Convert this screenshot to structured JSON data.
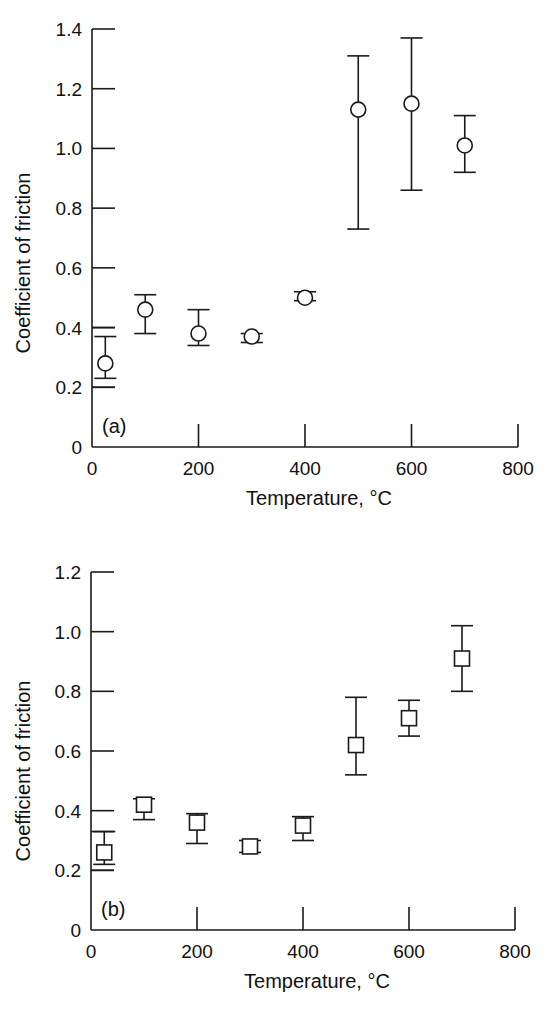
{
  "chart_data": [
    {
      "type": "scatter",
      "panel_label": "(a)",
      "marker": "circle",
      "xlabel": "Temperature, °C",
      "ylabel": "Coefficient of friction",
      "xlim": [
        0,
        800
      ],
      "ylim": [
        0,
        1.4
      ],
      "xticks": [
        0,
        200,
        400,
        600,
        800
      ],
      "yticks": [
        0,
        0.2,
        0.4,
        0.6,
        0.8,
        1.0,
        1.2,
        1.4
      ],
      "ytick_labels": [
        "0",
        "0.2",
        "0.4",
        "0.6",
        "0.8",
        "1.0",
        "1.2",
        "1.4"
      ],
      "grid": false,
      "extra_y_markers": [
        0.4,
        0.2
      ],
      "x": [
        25,
        100,
        200,
        300,
        400,
        500,
        600,
        700
      ],
      "values": [
        0.28,
        0.46,
        0.38,
        0.37,
        0.5,
        1.13,
        1.15,
        1.01
      ],
      "err_low": [
        0.23,
        0.38,
        0.34,
        0.35,
        0.49,
        0.73,
        0.86,
        0.92
      ],
      "err_high": [
        0.37,
        0.51,
        0.46,
        0.38,
        0.52,
        1.31,
        1.37,
        1.11
      ]
    },
    {
      "type": "scatter",
      "panel_label": "(b)",
      "marker": "square",
      "xlabel": "Temperature, °C",
      "ylabel": "Coefficient of friction",
      "xlim": [
        0,
        800
      ],
      "ylim": [
        0,
        1.2
      ],
      "xticks": [
        0,
        200,
        400,
        600,
        800
      ],
      "yticks": [
        0,
        0.2,
        0.4,
        0.6,
        0.8,
        1.0,
        1.2
      ],
      "ytick_labels": [
        "0",
        "0.2",
        "0.4",
        "0.6",
        "0.8",
        "1.0",
        "1.2"
      ],
      "grid": false,
      "extra_y_markers": [
        0.33,
        0.2
      ],
      "x": [
        25,
        100,
        200,
        300,
        400,
        500,
        600,
        700
      ],
      "values": [
        0.26,
        0.42,
        0.36,
        0.28,
        0.35,
        0.62,
        0.71,
        0.91
      ],
      "err_low": [
        0.22,
        0.37,
        0.29,
        0.26,
        0.3,
        0.52,
        0.65,
        0.8
      ],
      "err_high": [
        0.33,
        0.44,
        0.39,
        0.3,
        0.38,
        0.78,
        0.77,
        1.02
      ]
    }
  ],
  "layout": [
    {
      "x0": 92,
      "x1": 518,
      "y0": 447,
      "ytop": 29
    },
    {
      "x0": 91,
      "x1": 515,
      "y0": 930,
      "ytop": 572
    }
  ]
}
